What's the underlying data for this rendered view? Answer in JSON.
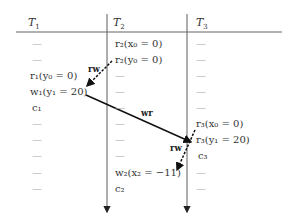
{
  "columns": [
    {
      "label": "T",
      "sub": "1",
      "x": 28
    },
    {
      "label": "T",
      "sub": "2",
      "x": 113
    },
    {
      "label": "T",
      "sub": "3",
      "x": 196
    }
  ],
  "rows_y": [
    38,
    54,
    70,
    86,
    102,
    118,
    134,
    150,
    167,
    183
  ],
  "cells": {
    "T1": [
      "—",
      "—",
      "r₁(y₀ = 0)",
      "w₁(y₁ = 20)",
      "c₁",
      "—",
      "—",
      "—",
      "—",
      "—"
    ],
    "T2": [
      "r₂(x₀ = 0)",
      "r₂(y₀ = 0)",
      "—",
      "—",
      "—",
      "—",
      "—",
      "—",
      "w₂(x₂ = −11)",
      "c₂"
    ],
    "T3": [
      "—",
      "—",
      "—",
      "—",
      "—",
      "—",
      "r₃(x₀ = 0)",
      "r₃(y₁ = 20)",
      "c₃",
      "—",
      "—"
    ]
  },
  "edges": [
    {
      "label": "rw",
      "type": "dashed",
      "from": "r2(y0=0)",
      "to": "w1(y1=20)"
    },
    {
      "label": "wr",
      "type": "solid",
      "from": "w1(y1=20)",
      "to": "r3(y1=20)"
    },
    {
      "label": "rw",
      "type": "dashed",
      "from": "r3(x0=0)",
      "to": "w2(x2=-11)"
    }
  ]
}
